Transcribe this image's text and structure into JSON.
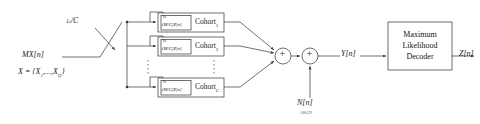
{
  "diagram": {
    "title_hidden": "",
    "input": {
      "signal_label": "MX[n]",
      "set_label": "X = {X",
      "set_sub1": "1",
      "set_mid": ",...,X",
      "set_sub2": "Q",
      "set_end": "}"
    },
    "splitter": {
      "fraction_numerator": "1",
      "fraction_numerator_sub": "s",
      "fraction_denominator": "C",
      "fraction_slash": "/"
    },
    "cohorts": [
      {
        "name": "Cohort",
        "subscript": "1",
        "inner_top": "I",
        "inner_top_sub": "s",
        "inner_main": "(M/C)X[n]"
      },
      {
        "name": "Cohort",
        "subscript": "2",
        "inner_top": "I",
        "inner_top_sub": "s",
        "inner_main": "(M/C)X[n]"
      },
      {
        "name": "Cohort",
        "subscript": "C",
        "inner_top": "I",
        "inner_top_sub": "s",
        "inner_main": "(M/C)X[n]"
      }
    ],
    "ellipsis_marker": "⋮",
    "adders": [
      {
        "symbol": "+",
        "name": "cohort-sum"
      },
      {
        "symbol": "+",
        "name": "noise-sum"
      }
    ],
    "noise": {
      "label": "N[n]",
      "sublabel": "AWGN"
    },
    "signals": {
      "after_noise": "Y[n]",
      "output": "Z[n]"
    },
    "decoder": {
      "line1": "Maximum",
      "line2": "Likelihood",
      "line3": "Decoder"
    },
    "colors": {
      "stroke": "#333333",
      "text": "#1a1a1a",
      "background": "#ffffff"
    }
  }
}
